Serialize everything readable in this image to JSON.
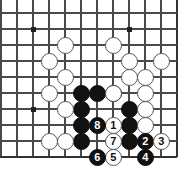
{
  "figure": {
    "kind": "go-board-diagram",
    "width": 184,
    "height": 178,
    "background_color": "#ffffff"
  },
  "board": {
    "line_color": "#4a4a4a",
    "edge_line_color": "#333333",
    "star_point_color": "#222222",
    "cell_size": 16,
    "origin_x": 1,
    "origin_y": 13,
    "columns": 12,
    "rows": 10,
    "edges": {
      "right_column_index": 11,
      "bottom_row_index": 9
    },
    "star_points": [
      {
        "col": 2,
        "row": 1
      },
      {
        "col": 8,
        "row": 1
      },
      {
        "col": 2,
        "row": 6
      }
    ]
  },
  "stones": {
    "black_label": "Black",
    "white_label": "White",
    "plain": [
      {
        "color": "black",
        "col": 5,
        "row": 5
      },
      {
        "color": "black",
        "col": 6,
        "row": 5
      },
      {
        "color": "black",
        "col": 7,
        "row": 5
      },
      {
        "color": "black",
        "col": 5,
        "row": 6
      },
      {
        "color": "black",
        "col": 8,
        "row": 6
      },
      {
        "color": "black",
        "col": 5,
        "row": 7
      },
      {
        "color": "black",
        "col": 8,
        "row": 7
      },
      {
        "color": "black",
        "col": 5,
        "row": 8
      },
      {
        "color": "black",
        "col": 8,
        "row": 8
      },
      {
        "color": "white",
        "col": 4,
        "row": 2
      },
      {
        "color": "white",
        "col": 7,
        "row": 2
      },
      {
        "color": "white",
        "col": 3,
        "row": 3
      },
      {
        "color": "white",
        "col": 8,
        "row": 3
      },
      {
        "color": "white",
        "col": 10,
        "row": 3
      },
      {
        "color": "white",
        "col": 4,
        "row": 4
      },
      {
        "color": "white",
        "col": 8,
        "row": 4
      },
      {
        "color": "white",
        "col": 9,
        "row": 4
      },
      {
        "color": "white",
        "col": 3,
        "row": 5
      },
      {
        "color": "white",
        "col": 7,
        "row": 5
      },
      {
        "color": "white",
        "col": 9,
        "row": 5
      },
      {
        "color": "white",
        "col": 4,
        "row": 6
      },
      {
        "color": "white",
        "col": 9,
        "row": 6
      },
      {
        "color": "white",
        "col": 9,
        "row": 7
      },
      {
        "color": "white",
        "col": 3,
        "row": 8
      },
      {
        "color": "white",
        "col": 4,
        "row": 8
      }
    ],
    "numbered": [
      {
        "label": "1",
        "color": "white",
        "col": 7,
        "row": 7
      },
      {
        "label": "2",
        "color": "black",
        "col": 9,
        "row": 8
      },
      {
        "label": "3",
        "color": "white",
        "col": 10,
        "row": 8
      },
      {
        "label": "4",
        "color": "black",
        "col": 9,
        "row": 9
      },
      {
        "label": "5",
        "color": "white",
        "col": 7,
        "row": 9
      },
      {
        "label": "6",
        "color": "black",
        "col": 6,
        "row": 9
      },
      {
        "label": "7",
        "color": "white",
        "col": 7,
        "row": 8
      },
      {
        "label": "8",
        "color": "black",
        "col": 6,
        "row": 7
      }
    ]
  }
}
